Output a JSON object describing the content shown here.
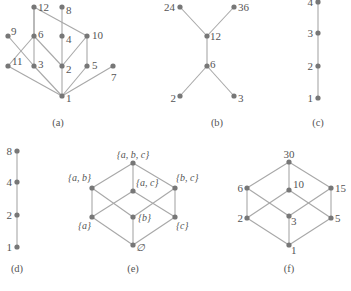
{
  "colors": {
    "edge": "#a8a8a8",
    "node": "#777777",
    "text": "#555555",
    "background": "#ffffff"
  },
  "diagrams": [
    {
      "id": "a",
      "caption": "(a)",
      "caption_pos": [
        58,
        126
      ],
      "nodes": [
        {
          "label": "12",
          "x": 34,
          "y": 7,
          "lx": 4,
          "ly": 4,
          "anchor": "start"
        },
        {
          "label": "8",
          "x": 62,
          "y": 7,
          "lx": 4,
          "ly": 7,
          "anchor": "start"
        },
        {
          "label": "9",
          "x": 8,
          "y": 36,
          "lx": 3,
          "ly": -1,
          "anchor": "start"
        },
        {
          "label": "6",
          "x": 34,
          "y": 36,
          "lx": 4,
          "ly": 2,
          "anchor": "start"
        },
        {
          "label": "4",
          "x": 62,
          "y": 36,
          "lx": 4,
          "ly": 7,
          "anchor": "start"
        },
        {
          "label": "10",
          "x": 87,
          "y": 36,
          "lx": 5,
          "ly": 3,
          "anchor": "start"
        },
        {
          "label": "11",
          "x": 8,
          "y": 66,
          "lx": 4,
          "ly": -1,
          "anchor": "start"
        },
        {
          "label": "3",
          "x": 34,
          "y": 66,
          "lx": 4,
          "ly": 2,
          "anchor": "start"
        },
        {
          "label": "2",
          "x": 62,
          "y": 66,
          "lx": 4,
          "ly": 7,
          "anchor": "start"
        },
        {
          "label": "5",
          "x": 87,
          "y": 66,
          "lx": 5,
          "ly": 3,
          "anchor": "start"
        },
        {
          "label": "7",
          "x": 113,
          "y": 66,
          "lx": -2,
          "ly": 15,
          "anchor": "start"
        },
        {
          "label": "1",
          "x": 62,
          "y": 96,
          "lx": 4,
          "ly": 6,
          "anchor": "start"
        }
      ],
      "edges": [
        [
          0,
          5
        ],
        [
          0,
          7
        ],
        [
          0,
          3
        ],
        [
          1,
          4
        ],
        [
          2,
          7
        ],
        [
          3,
          8
        ],
        [
          3,
          6
        ],
        [
          4,
          8
        ],
        [
          5,
          8
        ],
        [
          5,
          9
        ],
        [
          6,
          11
        ],
        [
          7,
          11
        ],
        [
          8,
          11
        ],
        [
          9,
          11
        ],
        [
          10,
          11
        ]
      ]
    },
    {
      "id": "b",
      "caption": "(b)",
      "caption_pos": [
        217,
        126
      ],
      "nodes": [
        {
          "label": "24",
          "x": 180,
          "y": 7,
          "lx": -5,
          "ly": 4,
          "anchor": "end"
        },
        {
          "label": "36",
          "x": 234,
          "y": 7,
          "lx": 4,
          "ly": 4,
          "anchor": "start"
        },
        {
          "label": "12",
          "x": 207,
          "y": 36,
          "lx": 3,
          "ly": 4,
          "anchor": "start"
        },
        {
          "label": "6",
          "x": 207,
          "y": 66,
          "lx": 3,
          "ly": 2,
          "anchor": "start"
        },
        {
          "label": "2",
          "x": 180,
          "y": 96,
          "lx": -4,
          "ly": 6,
          "anchor": "end"
        },
        {
          "label": "3",
          "x": 234,
          "y": 96,
          "lx": 4,
          "ly": 6,
          "anchor": "start"
        }
      ],
      "edges": [
        [
          0,
          2
        ],
        [
          1,
          2
        ],
        [
          2,
          3
        ],
        [
          3,
          4
        ],
        [
          3,
          5
        ]
      ]
    },
    {
      "id": "c",
      "caption": "(c)",
      "caption_pos": [
        318,
        126
      ],
      "nodes": [
        {
          "label": "4",
          "x": 318,
          "y": 2,
          "lx": -5,
          "ly": 4,
          "anchor": "end"
        },
        {
          "label": "3",
          "x": 318,
          "y": 33,
          "lx": -5,
          "ly": 4,
          "anchor": "end"
        },
        {
          "label": "2",
          "x": 318,
          "y": 66,
          "lx": -5,
          "ly": 4,
          "anchor": "end"
        },
        {
          "label": "1",
          "x": 318,
          "y": 98,
          "lx": -5,
          "ly": 4,
          "anchor": "end"
        }
      ],
      "edges": [
        [
          0,
          1
        ],
        [
          1,
          2
        ],
        [
          2,
          3
        ]
      ]
    },
    {
      "id": "d",
      "caption": "(d)",
      "caption_pos": [
        17,
        272
      ],
      "nodes": [
        {
          "label": "8",
          "x": 17,
          "y": 151,
          "lx": -5,
          "ly": 4,
          "anchor": "end"
        },
        {
          "label": "4",
          "x": 17,
          "y": 182,
          "lx": -5,
          "ly": 4,
          "anchor": "end"
        },
        {
          "label": "2",
          "x": 17,
          "y": 215,
          "lx": -5,
          "ly": 4,
          "anchor": "end"
        },
        {
          "label": "1",
          "x": 17,
          "y": 247,
          "lx": -5,
          "ly": 4,
          "anchor": "end"
        }
      ],
      "edges": [
        [
          0,
          1
        ],
        [
          1,
          2
        ],
        [
          2,
          3
        ]
      ]
    },
    {
      "id": "e",
      "caption": "(e)",
      "caption_pos": [
        133,
        272
      ],
      "set_labels": true,
      "nodes": [
        {
          "label": "{a, b, c}",
          "x": 133,
          "y": 163,
          "lx": 0,
          "ly": -5,
          "anchor": "middle"
        },
        {
          "label": "{a, b}",
          "x": 92,
          "y": 188,
          "lx": -1,
          "ly": -7,
          "anchor": "end"
        },
        {
          "label": "{a, c}",
          "x": 133,
          "y": 191,
          "lx": 3,
          "ly": -5,
          "anchor": "start"
        },
        {
          "label": "{b, c}",
          "x": 175,
          "y": 188,
          "lx": 1,
          "ly": -7,
          "anchor": "start"
        },
        {
          "label": "{a}",
          "x": 92,
          "y": 217,
          "lx": -1,
          "ly": 12,
          "anchor": "end"
        },
        {
          "label": "{b}",
          "x": 133,
          "y": 217,
          "lx": 5,
          "ly": 4,
          "anchor": "start"
        },
        {
          "label": "{c}",
          "x": 175,
          "y": 217,
          "lx": 1,
          "ly": 12,
          "anchor": "start"
        },
        {
          "label": "∅",
          "x": 133,
          "y": 245,
          "lx": 3,
          "ly": 6,
          "anchor": "start"
        }
      ],
      "edges": [
        [
          0,
          1
        ],
        [
          0,
          2
        ],
        [
          0,
          3
        ],
        [
          1,
          4
        ],
        [
          1,
          5
        ],
        [
          2,
          4
        ],
        [
          2,
          6
        ],
        [
          3,
          5
        ],
        [
          3,
          6
        ],
        [
          4,
          7
        ],
        [
          5,
          7
        ],
        [
          6,
          7
        ]
      ]
    },
    {
      "id": "f",
      "caption": "(f)",
      "caption_pos": [
        289,
        272
      ],
      "nodes": [
        {
          "label": "30",
          "x": 289,
          "y": 162,
          "lx": 0,
          "ly": -4,
          "anchor": "middle"
        },
        {
          "label": "6",
          "x": 247,
          "y": 188,
          "lx": -4,
          "ly": 4,
          "anchor": "end"
        },
        {
          "label": "10",
          "x": 289,
          "y": 190,
          "lx": 4,
          "ly": -2,
          "anchor": "start"
        },
        {
          "label": "15",
          "x": 331,
          "y": 188,
          "lx": 4,
          "ly": 4,
          "anchor": "start"
        },
        {
          "label": "2",
          "x": 247,
          "y": 218,
          "lx": -4,
          "ly": 4,
          "anchor": "end"
        },
        {
          "label": "3",
          "x": 289,
          "y": 216,
          "lx": 2,
          "ly": 9,
          "anchor": "start"
        },
        {
          "label": "5",
          "x": 331,
          "y": 218,
          "lx": 4,
          "ly": 4,
          "anchor": "start"
        },
        {
          "label": "1",
          "x": 289,
          "y": 245,
          "lx": 2,
          "ly": 9,
          "anchor": "start"
        }
      ],
      "edges": [
        [
          0,
          1
        ],
        [
          0,
          2
        ],
        [
          0,
          3
        ],
        [
          1,
          4
        ],
        [
          1,
          5
        ],
        [
          2,
          4
        ],
        [
          2,
          6
        ],
        [
          3,
          5
        ],
        [
          3,
          6
        ],
        [
          4,
          7
        ],
        [
          5,
          7
        ],
        [
          6,
          7
        ]
      ]
    }
  ]
}
